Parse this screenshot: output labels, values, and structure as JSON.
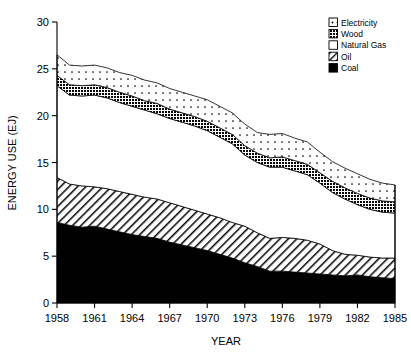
{
  "chart_data": {
    "type": "area",
    "stacked": true,
    "title": "",
    "xlabel": "YEAR",
    "ylabel": "ENERGY USE (EJ)",
    "xlim": [
      1958,
      1985
    ],
    "ylim": [
      0,
      30
    ],
    "grid": false,
    "legend_position": "top-right",
    "x": [
      1958,
      1959,
      1960,
      1961,
      1962,
      1963,
      1964,
      1965,
      1966,
      1967,
      1968,
      1969,
      1970,
      1971,
      1972,
      1973,
      1974,
      1975,
      1976,
      1977,
      1978,
      1979,
      1980,
      1981,
      1982,
      1983,
      1984,
      1985
    ],
    "xtick_labels": [
      "1958",
      "1961",
      "1964",
      "1967",
      "1970",
      "1973",
      "1976",
      "1979",
      "1982",
      "1985"
    ],
    "xticks": [
      1958,
      1961,
      1964,
      1967,
      1970,
      1973,
      1976,
      1979,
      1982,
      1985
    ],
    "yticks": [
      0,
      5,
      10,
      15,
      20,
      25,
      30
    ],
    "ytick_labels": [
      "0",
      "5",
      "10",
      "15",
      "20",
      "25",
      "30"
    ],
    "series": [
      {
        "name": "Coal",
        "fill": "solid-black",
        "color": "#000000",
        "values": [
          8.6,
          8.3,
          8.1,
          8.2,
          7.9,
          7.6,
          7.3,
          7.1,
          6.9,
          6.5,
          6.2,
          5.9,
          5.6,
          5.2,
          4.8,
          4.3,
          3.9,
          3.4,
          3.4,
          3.3,
          3.2,
          3.1,
          3.0,
          2.9,
          3.0,
          2.8,
          2.7,
          2.6
        ]
      },
      {
        "name": "Oil",
        "fill": "diagonal-hatch",
        "color": "#ffffff",
        "values": [
          4.8,
          4.4,
          4.4,
          4.2,
          4.3,
          4.3,
          4.3,
          4.2,
          4.2,
          4.2,
          4.1,
          4.0,
          3.9,
          3.9,
          3.8,
          3.9,
          3.6,
          3.5,
          3.6,
          3.6,
          3.5,
          3.2,
          2.6,
          2.3,
          2.1,
          2.1,
          2.1,
          2.2
        ]
      },
      {
        "name": "Natural Gas",
        "fill": "white",
        "color": "#ffffff",
        "values": [
          9.8,
          9.5,
          9.6,
          9.8,
          9.7,
          9.5,
          9.4,
          9.3,
          9.1,
          9.0,
          9.0,
          9.0,
          8.9,
          8.6,
          8.4,
          7.6,
          7.5,
          7.6,
          7.5,
          7.2,
          7.0,
          6.5,
          6.2,
          5.9,
          5.4,
          5.1,
          4.9,
          4.8
        ]
      },
      {
        "name": "Wood",
        "fill": "dark-crosshatch",
        "color": "#555555",
        "values": [
          1.1,
          1.1,
          1.1,
          1.1,
          1.1,
          1.1,
          1.1,
          1.0,
          1.1,
          1.0,
          1.0,
          1.0,
          1.0,
          1.0,
          1.0,
          1.0,
          1.0,
          1.0,
          1.1,
          1.1,
          1.1,
          1.1,
          1.2,
          1.2,
          1.2,
          1.2,
          1.2,
          1.2
        ]
      },
      {
        "name": "Electricity",
        "fill": "dotted",
        "color": "#ffffff",
        "values": [
          2.2,
          2.1,
          2.1,
          2.1,
          2.1,
          2.1,
          2.2,
          2.2,
          2.2,
          2.2,
          2.2,
          2.2,
          2.3,
          2.3,
          2.3,
          2.3,
          2.2,
          2.5,
          2.5,
          2.4,
          2.4,
          2.2,
          2.1,
          2.1,
          2.1,
          2.0,
          1.9,
          1.8
        ]
      }
    ],
    "totals": [
      26.5,
      25.4,
      25.3,
      25.4,
      25.1,
      24.6,
      24.3,
      23.8,
      23.5,
      22.9,
      22.5,
      22.1,
      21.7,
      21.0,
      20.3,
      19.1,
      18.2,
      18.0,
      18.1,
      17.6,
      17.2,
      16.1,
      15.1,
      14.4,
      13.8,
      13.2,
      12.8,
      12.6
    ]
  },
  "legend": {
    "items": [
      {
        "label": "Electricity",
        "swatch": "dotted"
      },
      {
        "label": "Wood",
        "swatch": "dark-crosshatch"
      },
      {
        "label": "Natural Gas",
        "swatch": "white"
      },
      {
        "label": "Oil",
        "swatch": "diagonal-hatch"
      },
      {
        "label": "Coal",
        "swatch": "solid-black"
      }
    ]
  },
  "axes": {
    "y_title": "ENERGY USE (EJ)",
    "x_title": "YEAR"
  }
}
